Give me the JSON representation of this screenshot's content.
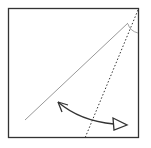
{
  "diagram": {
    "type": "origami-fold-step",
    "elements": [
      {
        "name": "paper-square",
        "kind": "square outline"
      },
      {
        "name": "crease-line",
        "kind": "solid gray line"
      },
      {
        "name": "valley-fold-line",
        "kind": "dotted line"
      },
      {
        "name": "angle-arc",
        "kind": "small arc marking angle"
      },
      {
        "name": "fold-arrow",
        "kind": "curved double arrow with hollow head"
      }
    ],
    "colors": {
      "paper_edge": "#333333",
      "crease": "#999999",
      "fold": "#333333",
      "arrow": "#333333"
    }
  }
}
